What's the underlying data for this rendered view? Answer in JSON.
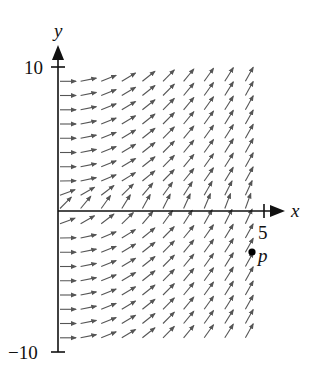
{
  "chart_data": {
    "type": "vector_field",
    "title": "",
    "xlabel": "x",
    "ylabel": "y",
    "x_ticks": [
      5
    ],
    "x_tick_labels": [
      "5"
    ],
    "y_ticks": [
      10,
      -10
    ],
    "y_tick_labels": [
      "10",
      "−10"
    ],
    "xlim": [
      0,
      5.5
    ],
    "ylim": [
      -10,
      10
    ],
    "grid": false,
    "field": {
      "description": "Slope field; arrow direction depends mainly on x (steeper as x increases); near y=0 arrows tilt upward more",
      "x_values": [
        0,
        0.5,
        1,
        1.5,
        2,
        2.5,
        3,
        3.5,
        4,
        4.5
      ],
      "y_values": [
        9,
        8,
        7,
        6,
        5,
        4,
        3,
        2,
        1,
        0,
        -1,
        -2,
        -3,
        -4,
        -5,
        -6,
        -7,
        -8,
        -9
      ],
      "slope_model": "0.4*x + exp(-y^2)",
      "arrow_length_px": 16,
      "arrow_color": "#555555"
    },
    "points": [
      {
        "label": "p",
        "x": 4.7,
        "y": -3
      }
    ]
  },
  "labels": {
    "x_axis": "x",
    "y_axis": "y",
    "tick_x_5": "5",
    "tick_y_10": "10",
    "tick_y_neg10": "−10",
    "point_p": "p"
  },
  "colors": {
    "axis": "#111111",
    "arrow": "#555555",
    "point": "#000000"
  }
}
